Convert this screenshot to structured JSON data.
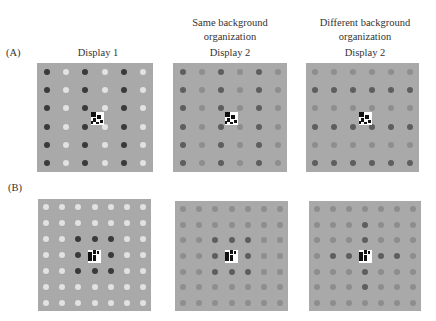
{
  "labels": {
    "row_a": "(A)",
    "row_b": "(B)",
    "col1_title": "Display 1",
    "col2_header_line1": "Same background",
    "col2_header_line2": "organization",
    "col2_title": "Display 2",
    "col3_header_line1": "Different background",
    "col3_header_line2": "organization",
    "col3_title": "Display 2"
  },
  "colors": {
    "background": "#a9a9a9",
    "dark": "#3a3a3a",
    "mid_dark": "#5e5e5e",
    "mid": "#8e8e8e",
    "light": "#e2e2e2"
  },
  "panels": [
    {
      "id": "a1",
      "row": "A",
      "x": 37,
      "y": 63,
      "w": 116,
      "h": 109,
      "grid": 6,
      "pattern": [
        "DLDLDL",
        "DLDLDL",
        "DLDLDL",
        "DLDLDL",
        "DLDLDL",
        "DLDLDL"
      ],
      "target": {
        "x": 91,
        "y": 112,
        "s": 13
      }
    },
    {
      "id": "a2",
      "row": "A",
      "x": 173,
      "y": 63,
      "w": 114,
      "h": 109,
      "grid": 6,
      "pattern": [
        "NMNMNM",
        "NMNMNM",
        "NMNMNM",
        "NMNMNM",
        "NMNMNM",
        "NMNMNM"
      ],
      "target": {
        "x": 225,
        "y": 112,
        "s": 13
      }
    },
    {
      "id": "a3",
      "row": "A",
      "x": 306,
      "y": 63,
      "w": 113,
      "h": 109,
      "grid": 6,
      "pattern": [
        "MMMMMM",
        "NNNNNN",
        "MMMMMM",
        "NNNNNN",
        "MMMMMM",
        "NNNNNN"
      ],
      "target": {
        "x": 359,
        "y": 112,
        "s": 13
      }
    },
    {
      "id": "b1",
      "row": "B",
      "x": 38,
      "y": 199,
      "w": 113,
      "h": 112,
      "grid": 7,
      "pattern": [
        "LLLLLLL",
        "LLLLLLL",
        "LLDDDLL",
        "LLDXDLL",
        "LLDDDLL",
        "LLLLLLL",
        "LLLLLLL"
      ],
      "target": {
        "x": 88,
        "y": 250,
        "s": 13
      }
    },
    {
      "id": "b2",
      "row": "B",
      "x": 175,
      "y": 201,
      "w": 113,
      "h": 110,
      "grid": 7,
      "pattern": [
        "MMMMMMM",
        "MMMMMMM",
        "MMNNNMM",
        "MMNXNMM",
        "MMNNNMM",
        "MMMMMMM",
        "MMMMMMM"
      ],
      "target": {
        "x": 225,
        "y": 250,
        "s": 13
      }
    },
    {
      "id": "b3",
      "row": "B",
      "x": 309,
      "y": 201,
      "w": 112,
      "h": 110,
      "grid": 7,
      "pattern": [
        "MMMMMMM",
        "MMMNMMM",
        "MMMNMMM",
        "MNNXNNM",
        "MMMNMMM",
        "MMMNMMM",
        "MMMMMMM"
      ],
      "target": {
        "x": 359,
        "y": 250,
        "s": 13
      }
    }
  ]
}
